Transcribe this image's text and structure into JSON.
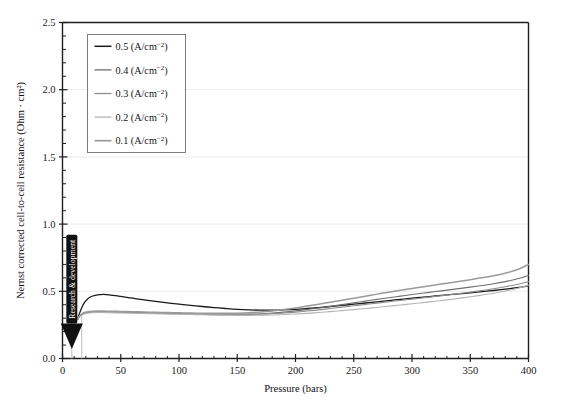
{
  "figure": {
    "background": "#ffffff",
    "frame_color": "#1f1f1f"
  },
  "annotation": {
    "label": "Research & development",
    "arrow_color": "#111111",
    "text_color": "#ffffff",
    "x_position": 8
  },
  "chart_data": {
    "type": "line",
    "title": "",
    "xlabel": "Pressure (bars)",
    "ylabel": "Nernst corrected cell-to-cell resistance (Ohm · cm²)",
    "xlim": [
      0,
      400
    ],
    "ylim": [
      0.0,
      2.5
    ],
    "xticks": [
      0,
      50,
      100,
      150,
      200,
      250,
      300,
      350,
      400
    ],
    "xticklabels": [
      "0",
      "50",
      "100",
      "150",
      "200",
      "250",
      "300",
      "350",
      "400"
    ],
    "yticks": [
      0.0,
      0.5,
      1.0,
      1.5,
      2.0,
      2.5
    ],
    "yticklabels": [
      "0.0",
      "0.5",
      "1.0",
      "1.5",
      "2.0",
      "2.5"
    ],
    "minor_tick_interval_y": 0.1,
    "grid": true,
    "grid_axis": "y",
    "grid_color": "#e9e9e9",
    "legend_position": "upper left",
    "legend_entries": [
      "0.5 (A/cm⁻²)",
      "0.4 (A/cm⁻²)",
      "0.3 (A/cm⁻²)",
      "0.2 (A/cm⁻²)",
      "0.1 (A/cm⁻²)"
    ],
    "x": [
      13,
      15,
      18,
      22,
      26,
      30,
      35,
      40,
      50,
      60,
      70,
      80,
      90,
      100,
      110,
      120,
      130,
      140,
      150,
      160,
      170,
      180,
      190,
      200,
      210,
      220,
      230,
      240,
      250,
      260,
      270,
      280,
      290,
      300,
      310,
      320,
      330,
      340,
      350,
      360,
      370,
      380,
      390,
      400
    ],
    "series": [
      {
        "name": "0.5 (A/cm⁻²)",
        "current_density": 0.5,
        "unit": "A/cm⁻²",
        "color": "#1a1a1a",
        "linewidth": 1.3,
        "values": [
          0.295,
          0.345,
          0.405,
          0.447,
          0.465,
          0.474,
          0.477,
          0.474,
          0.462,
          0.449,
          0.437,
          0.425,
          0.414,
          0.404,
          0.395,
          0.387,
          0.379,
          0.372,
          0.366,
          0.362,
          0.36,
          0.36,
          0.362,
          0.366,
          0.372,
          0.379,
          0.387,
          0.395,
          0.404,
          0.413,
          0.422,
          0.431,
          0.44,
          0.449,
          0.457,
          0.465,
          0.473,
          0.481,
          0.489,
          0.497,
          0.506,
          0.516,
          0.527,
          0.54
        ]
      },
      {
        "name": "0.4 (A/cm⁻²)",
        "current_density": 0.4,
        "unit": "A/cm⁻²",
        "color": "#6f6f6f",
        "linewidth": 1.1,
        "values": [
          0.292,
          0.318,
          0.336,
          0.344,
          0.347,
          0.348,
          0.348,
          0.347,
          0.345,
          0.343,
          0.341,
          0.339,
          0.337,
          0.335,
          0.333,
          0.331,
          0.33,
          0.329,
          0.329,
          0.33,
          0.333,
          0.338,
          0.345,
          0.354,
          0.364,
          0.376,
          0.388,
          0.401,
          0.414,
          0.427,
          0.44,
          0.452,
          0.464,
          0.476,
          0.487,
          0.498,
          0.509,
          0.52,
          0.531,
          0.543,
          0.556,
          0.572,
          0.592,
          0.618
        ]
      },
      {
        "name": "0.3 (A/cm⁻²)",
        "current_density": 0.3,
        "unit": "A/cm⁻²",
        "color": "#8d8d8d",
        "linewidth": 1.1,
        "values": [
          0.29,
          0.315,
          0.333,
          0.341,
          0.344,
          0.345,
          0.345,
          0.344,
          0.342,
          0.34,
          0.338,
          0.336,
          0.334,
          0.332,
          0.33,
          0.328,
          0.327,
          0.326,
          0.326,
          0.327,
          0.329,
          0.333,
          0.338,
          0.345,
          0.353,
          0.362,
          0.372,
          0.382,
          0.392,
          0.402,
          0.412,
          0.422,
          0.432,
          0.442,
          0.452,
          0.462,
          0.472,
          0.483,
          0.494,
          0.506,
          0.519,
          0.534,
          0.551,
          0.572
        ]
      },
      {
        "name": "0.2 (A/cm⁻²)",
        "current_density": 0.2,
        "unit": "A/cm⁻²",
        "color": "#b4b4b4",
        "linewidth": 1.1,
        "values": [
          0.288,
          0.313,
          0.33,
          0.338,
          0.341,
          0.342,
          0.342,
          0.341,
          0.339,
          0.337,
          0.335,
          0.333,
          0.331,
          0.329,
          0.327,
          0.325,
          0.323,
          0.322,
          0.321,
          0.321,
          0.322,
          0.324,
          0.327,
          0.331,
          0.336,
          0.342,
          0.349,
          0.356,
          0.364,
          0.372,
          0.38,
          0.389,
          0.398,
          0.407,
          0.416,
          0.426,
          0.436,
          0.447,
          0.459,
          0.472,
          0.486,
          0.502,
          0.521,
          0.545
        ]
      },
      {
        "name": "0.1 (A/cm⁻²)",
        "current_density": 0.1,
        "unit": "A/cm⁻²",
        "color": "#9a9a9a",
        "linewidth": 1.5,
        "values": [
          0.294,
          0.32,
          0.34,
          0.349,
          0.352,
          0.353,
          0.353,
          0.352,
          0.35,
          0.348,
          0.346,
          0.344,
          0.342,
          0.34,
          0.338,
          0.337,
          0.336,
          0.336,
          0.337,
          0.34,
          0.346,
          0.354,
          0.364,
          0.376,
          0.39,
          0.404,
          0.419,
          0.434,
          0.449,
          0.464,
          0.479,
          0.493,
          0.507,
          0.521,
          0.534,
          0.547,
          0.56,
          0.573,
          0.586,
          0.6,
          0.616,
          0.635,
          0.66,
          0.7
        ]
      }
    ]
  }
}
